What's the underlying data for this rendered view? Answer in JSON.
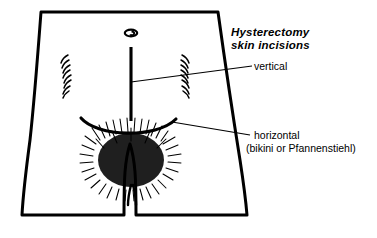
{
  "figure": {
    "title_line1": "Hysterectomy",
    "title_line2": "skin incisions",
    "labels": {
      "vertical": "vertical",
      "horizontal": "horizontal",
      "horizontal_alt": "(bikini or Pfannenstiehl)"
    },
    "anatomy": {
      "navel_name": "navel",
      "torso_name": "lower-abdomen-torso",
      "pubic_hair_name": "pubic-hair",
      "left_flank_shading": "left-flank-hatching",
      "right_flank_shading": "right-flank-hatching"
    },
    "incisions": [
      {
        "id": "vertical",
        "label": "vertical",
        "orientation": "vertical",
        "description": "midline vertical skin incision below the navel"
      },
      {
        "id": "horizontal",
        "label": "horizontal",
        "alt_names": "(bikini or Pfannenstiehl)",
        "orientation": "horizontal",
        "description": "low transverse curved suprapubic skin incision"
      }
    ],
    "colors": {
      "ink": "#000000",
      "background": "#ffffff"
    }
  }
}
